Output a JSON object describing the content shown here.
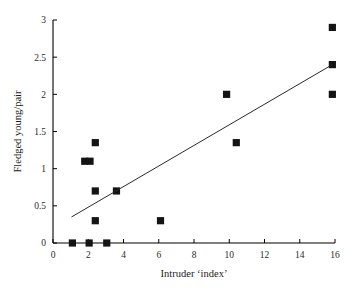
{
  "chart_data": {
    "type": "scatter",
    "title": "",
    "xlabel": "Intruder ‘index’",
    "ylabel": "Fledged young/pair",
    "xlim": [
      0,
      16
    ],
    "ylim": [
      0,
      3
    ],
    "grid": false,
    "legend": null,
    "xticks": [
      "0",
      "2",
      "4",
      "6",
      "8",
      "10",
      "12",
      "14",
      "16"
    ],
    "xtick_values": [
      0,
      2,
      4,
      6,
      8,
      10,
      12,
      14,
      16
    ],
    "yticks": [
      "0",
      "0.5",
      "1",
      "1.5",
      "2",
      "2.5",
      "3"
    ],
    "ytick_values": [
      0,
      0.5,
      1,
      1.5,
      2,
      2.5,
      3
    ],
    "marker_style": "filled-square",
    "marker_color": "#141414",
    "points": [
      {
        "x": 1.1,
        "y": 0.0
      },
      {
        "x": 2.05,
        "y": 0.0
      },
      {
        "x": 3.05,
        "y": 0.0
      },
      {
        "x": 2.4,
        "y": 0.3
      },
      {
        "x": 6.1,
        "y": 0.3
      },
      {
        "x": 2.4,
        "y": 0.7
      },
      {
        "x": 3.6,
        "y": 0.7
      },
      {
        "x": 1.8,
        "y": 1.1
      },
      {
        "x": 2.1,
        "y": 1.1
      },
      {
        "x": 2.4,
        "y": 1.35
      },
      {
        "x": 10.4,
        "y": 1.35
      },
      {
        "x": 9.85,
        "y": 2.0
      },
      {
        "x": 15.85,
        "y": 2.0
      },
      {
        "x": 15.85,
        "y": 2.4
      },
      {
        "x": 15.85,
        "y": 2.9
      }
    ],
    "trendline": {
      "label": "linear fit",
      "color": "#2a2a2a",
      "x_start": 1.05,
      "y_start": 0.35,
      "x_end": 15.85,
      "y_end": 2.4
    }
  }
}
